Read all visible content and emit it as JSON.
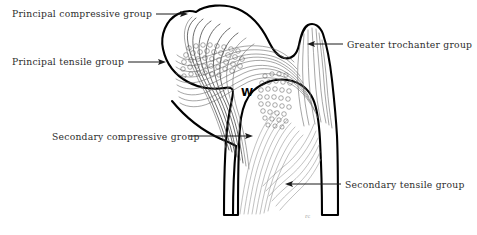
{
  "figure": {
    "background_color": "#ffffff",
    "outline_color": "#000000",
    "trabecula_color": "#6e6e6e",
    "label_color": "#2c2c2c",
    "leader_color": "#1a1a1a",
    "width": 477,
    "height": 235
  },
  "labels": [
    {
      "id": "principal-compressive-group",
      "text": "Principal compressive group",
      "text_x": 12,
      "text_y": 17,
      "anchor": "start",
      "leader": "M 156 14 L 185 14",
      "arrow": "M 188 14 L 180 11 L 181.5 14 L 180 17 Z"
    },
    {
      "id": "principal-tensile-group",
      "text": "Principal tensile group",
      "text_x": 12,
      "text_y": 65,
      "anchor": "start",
      "leader": "M 128 62 L 163 62",
      "arrow": "M 166 62 L 158 59 L 159.5 62 L 158 65 Z"
    },
    {
      "id": "greater-trochanter-group",
      "text": "Greater trochanter group",
      "text_x": 347,
      "text_y": 48,
      "anchor": "start",
      "leader": "M 343 44 L 311 44",
      "arrow": "M 307 44 L 315 41 L 313.5 44 L 315 47 Z"
    },
    {
      "id": "secondary-compressive-group",
      "text": "Secondary compressive group",
      "text_x": 52,
      "text_y": 140,
      "anchor": "start",
      "leader": "M 189 136 L 249 136",
      "arrow": "M 253 136 L 245 133 L 246.5 136 L 245 139 Z"
    },
    {
      "id": "secondary-tensile-group",
      "text": "Secondary tensile group",
      "text_x": 345,
      "text_y": 188,
      "anchor": "start",
      "leader": "M 341 184 L 289 184",
      "arrow": "M 285 184 L 293 181 L 291.5 184 L 293 187 Z"
    }
  ],
  "markers": [
    {
      "id": "wards-triangle-marker",
      "text": "W",
      "x": 247,
      "y": 96
    }
  ],
  "signature": {
    "text": "rc",
    "x": 305,
    "y": 218
  }
}
